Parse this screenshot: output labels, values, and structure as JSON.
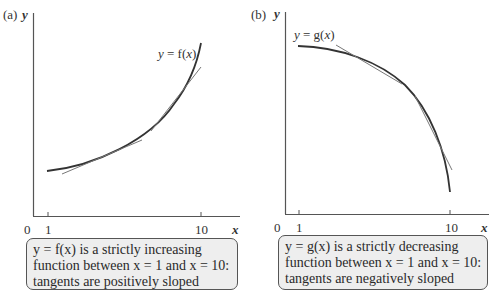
{
  "panels": [
    {
      "id": "a",
      "panel_label": "(a)",
      "y_axis_label": "y",
      "x_axis_label": "x",
      "origin_label": "0",
      "x_ticks": [
        "1",
        "10"
      ],
      "curve_label": "y = f(x)",
      "curve_type": "strictly increasing, convex",
      "tangent_count": 2,
      "caption": {
        "line1": "y = f(x) is a strictly increasing",
        "line2": "function between x = 1 and x = 10:",
        "line3": "tangents are positively sloped"
      }
    },
    {
      "id": "b",
      "panel_label": "(b)",
      "y_axis_label": "y",
      "x_axis_label": "x",
      "origin_label": "0",
      "x_ticks": [
        "1",
        "10"
      ],
      "curve_label": "y = g(x)",
      "curve_type": "strictly decreasing, concave",
      "tangent_count": 2,
      "caption": {
        "line1": "y = g(x) is a strictly decreasing",
        "line2": "function between x = 1 and x = 10:",
        "line3": "tangents are negatively sloped"
      }
    }
  ],
  "colors": {
    "axis": "#555555",
    "curve": "#333333",
    "tangent": "#777777",
    "caption_bg": "#eeeeee",
    "caption_border": "#555555"
  }
}
